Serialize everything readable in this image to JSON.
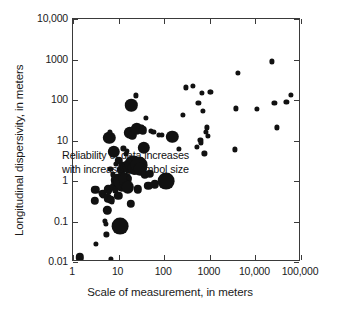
{
  "chart_data": {
    "type": "scatter",
    "title": "",
    "xlabel": "Scale of measurement, in meters",
    "ylabel": "Longitudinal dispersivity, in meters",
    "xscale": "log",
    "yscale": "log",
    "xlim": [
      1,
      100000
    ],
    "ylim": [
      0.01,
      10000
    ],
    "grid": false,
    "legend": null,
    "xticklabels": [
      "1",
      "10",
      "100",
      "1000",
      "10,000",
      "100,000"
    ],
    "xtickvalues": [
      1,
      10,
      100,
      1000,
      10000,
      100000
    ],
    "yticklabels": [
      "0.01",
      "0.1",
      "1",
      "10",
      "100",
      "1000",
      "10,000"
    ],
    "ytickvalues": [
      0.01,
      0.1,
      1,
      10,
      100,
      1000,
      10000
    ],
    "annotations": [
      "Reliability of data increases",
      "with increasing symbol size"
    ],
    "size_encoding": "Symbol size encodes data reliability; larger symbols indicate more reliable data.",
    "marker_color": "#111111",
    "frame_color": "#3a3a3a",
    "size_classes": {
      "small": 2.6,
      "medium": 4.2,
      "large": 6.2,
      "xlarge": 8.4
    },
    "points": [
      {
        "x": 1.4,
        "y": 0.013,
        "size": "medium"
      },
      {
        "x": 3.0,
        "y": 0.33,
        "size": "medium"
      },
      {
        "x": 3.1,
        "y": 0.6,
        "size": "medium"
      },
      {
        "x": 3.2,
        "y": 0.028,
        "size": "small"
      },
      {
        "x": 4.2,
        "y": 0.52,
        "size": "small"
      },
      {
        "x": 4.5,
        "y": 0.49,
        "size": "medium"
      },
      {
        "x": 4.6,
        "y": 0.42,
        "size": "small"
      },
      {
        "x": 5.0,
        "y": 0.105,
        "size": "small"
      },
      {
        "x": 5.2,
        "y": 0.088,
        "size": "small"
      },
      {
        "x": 5.4,
        "y": 0.048,
        "size": "small"
      },
      {
        "x": 5.6,
        "y": 0.19,
        "size": "medium"
      },
      {
        "x": 5.8,
        "y": 0.37,
        "size": "medium"
      },
      {
        "x": 6.0,
        "y": 0.62,
        "size": "medium"
      },
      {
        "x": 6.1,
        "y": 0.55,
        "size": "small"
      },
      {
        "x": 6.3,
        "y": 11.5,
        "size": "large"
      },
      {
        "x": 6.4,
        "y": 16.0,
        "size": "small"
      },
      {
        "x": 6.6,
        "y": 2.0,
        "size": "small"
      },
      {
        "x": 6.8,
        "y": 0.34,
        "size": "medium"
      },
      {
        "x": 6.9,
        "y": 0.012,
        "size": "small"
      },
      {
        "x": 7.2,
        "y": 0.3,
        "size": "small"
      },
      {
        "x": 7.5,
        "y": 1.45,
        "size": "small"
      },
      {
        "x": 7.8,
        "y": 5.2,
        "size": "large"
      },
      {
        "x": 8.0,
        "y": 0.72,
        "size": "medium"
      },
      {
        "x": 8.2,
        "y": 0.63,
        "size": "small"
      },
      {
        "x": 8.5,
        "y": 0.56,
        "size": "small"
      },
      {
        "x": 8.8,
        "y": 2.6,
        "size": "small"
      },
      {
        "x": 9.0,
        "y": 1.05,
        "size": "large"
      },
      {
        "x": 9.4,
        "y": 0.95,
        "size": "medium"
      },
      {
        "x": 9.8,
        "y": 0.43,
        "size": "medium"
      },
      {
        "x": 10.2,
        "y": 3.1,
        "size": "medium"
      },
      {
        "x": 10.5,
        "y": 0.98,
        "size": "large"
      },
      {
        "x": 10.8,
        "y": 0.88,
        "size": "medium"
      },
      {
        "x": 11.0,
        "y": 0.078,
        "size": "xlarge"
      },
      {
        "x": 11.5,
        "y": 1.9,
        "size": "medium"
      },
      {
        "x": 11.8,
        "y": 0.76,
        "size": "large"
      },
      {
        "x": 12.0,
        "y": 1.0,
        "size": "xlarge"
      },
      {
        "x": 12.5,
        "y": 2.3,
        "size": "medium"
      },
      {
        "x": 12.8,
        "y": 6.4,
        "size": "small"
      },
      {
        "x": 13.0,
        "y": 0.82,
        "size": "medium"
      },
      {
        "x": 13.5,
        "y": 2.2,
        "size": "medium"
      },
      {
        "x": 14.0,
        "y": 1.1,
        "size": "large"
      },
      {
        "x": 14.5,
        "y": 4.6,
        "size": "small"
      },
      {
        "x": 15.0,
        "y": 5.6,
        "size": "small"
      },
      {
        "x": 15.5,
        "y": 2.5,
        "size": "medium"
      },
      {
        "x": 16.0,
        "y": 0.7,
        "size": "large"
      },
      {
        "x": 16.5,
        "y": 2.15,
        "size": "large"
      },
      {
        "x": 17.0,
        "y": 1.2,
        "size": "small"
      },
      {
        "x": 17.5,
        "y": 15.5,
        "size": "large"
      },
      {
        "x": 18.0,
        "y": 2.4,
        "size": "medium"
      },
      {
        "x": 18.5,
        "y": 0.27,
        "size": "medium"
      },
      {
        "x": 19.0,
        "y": 74.0,
        "size": "large"
      },
      {
        "x": 20.0,
        "y": 13.5,
        "size": "medium"
      },
      {
        "x": 21.0,
        "y": 2.6,
        "size": "xlarge"
      },
      {
        "x": 22.0,
        "y": 2.05,
        "size": "large"
      },
      {
        "x": 23.0,
        "y": 1.85,
        "size": "medium"
      },
      {
        "x": 24.0,
        "y": 130.0,
        "size": "small"
      },
      {
        "x": 25.0,
        "y": 19.5,
        "size": "large"
      },
      {
        "x": 26.0,
        "y": 0.62,
        "size": "medium"
      },
      {
        "x": 28.0,
        "y": 2.45,
        "size": "xlarge"
      },
      {
        "x": 30.0,
        "y": 1.95,
        "size": "large"
      },
      {
        "x": 32.0,
        "y": 22.0,
        "size": "small"
      },
      {
        "x": 34.0,
        "y": 18.0,
        "size": "medium"
      },
      {
        "x": 36.0,
        "y": 6.6,
        "size": "large"
      },
      {
        "x": 38.0,
        "y": 1.4,
        "size": "medium"
      },
      {
        "x": 40.0,
        "y": 36.0,
        "size": "small"
      },
      {
        "x": 45.0,
        "y": 0.75,
        "size": "medium"
      },
      {
        "x": 48.0,
        "y": 1.5,
        "size": "medium"
      },
      {
        "x": 52.0,
        "y": 17.5,
        "size": "small"
      },
      {
        "x": 58.0,
        "y": 16.5,
        "size": "small"
      },
      {
        "x": 62.0,
        "y": 0.83,
        "size": "medium"
      },
      {
        "x": 75.0,
        "y": 14.0,
        "size": "small"
      },
      {
        "x": 90.0,
        "y": 13.5,
        "size": "small"
      },
      {
        "x": 110.0,
        "y": 1.0,
        "size": "xlarge"
      },
      {
        "x": 150.0,
        "y": 12.5,
        "size": "large"
      },
      {
        "x": 210.0,
        "y": 6.1,
        "size": "small"
      },
      {
        "x": 260.0,
        "y": 42.0,
        "size": "small"
      },
      {
        "x": 300.0,
        "y": 205.0,
        "size": "small"
      },
      {
        "x": 420.0,
        "y": 220.0,
        "size": "small"
      },
      {
        "x": 520.0,
        "y": 7.0,
        "size": "small"
      },
      {
        "x": 560.0,
        "y": 85.0,
        "size": "small"
      },
      {
        "x": 620.0,
        "y": 10.5,
        "size": "small"
      },
      {
        "x": 650.0,
        "y": 9.0,
        "size": "small"
      },
      {
        "x": 680.0,
        "y": 150.0,
        "size": "small"
      },
      {
        "x": 700.0,
        "y": 54.0,
        "size": "small"
      },
      {
        "x": 760.0,
        "y": 4.8,
        "size": "small"
      },
      {
        "x": 820.0,
        "y": 16.0,
        "size": "small"
      },
      {
        "x": 850.0,
        "y": 21.0,
        "size": "small"
      },
      {
        "x": 900.0,
        "y": 13.0,
        "size": "small"
      },
      {
        "x": 1000.0,
        "y": 160.0,
        "size": "small"
      },
      {
        "x": 1050.0,
        "y": 155.0,
        "size": "small"
      },
      {
        "x": 3600.0,
        "y": 6.0,
        "size": "small"
      },
      {
        "x": 3800.0,
        "y": 62.0,
        "size": "small"
      },
      {
        "x": 4200.0,
        "y": 460.0,
        "size": "small"
      },
      {
        "x": 11000.0,
        "y": 60.0,
        "size": "small"
      },
      {
        "x": 23000.0,
        "y": 900.0,
        "size": "small"
      },
      {
        "x": 26000.0,
        "y": 85.0,
        "size": "small"
      },
      {
        "x": 30000.0,
        "y": 21.0,
        "size": "small"
      },
      {
        "x": 48000.0,
        "y": 88.0,
        "size": "small"
      },
      {
        "x": 60000.0,
        "y": 135.0,
        "size": "small"
      }
    ]
  }
}
